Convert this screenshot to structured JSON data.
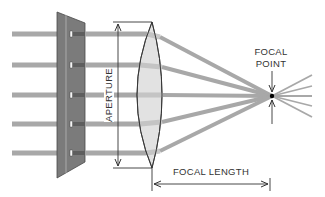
{
  "diagram": {
    "labels": {
      "aperture": "APERTURE",
      "focal_point_line1": "FOCAL",
      "focal_point_line2": "POINT",
      "focal_length": "FOCAL LENGTH"
    },
    "elements": {
      "plate": "slotted plate",
      "lens": "convex lens",
      "rays_count": 5
    },
    "colors": {
      "ray": "#a8a8a8",
      "ray_dark": "#6e6e6e",
      "plate": "#7b7b7b",
      "lens_fill": "#e2e2e2",
      "line": "#333333",
      "focal_dot": "#000000"
    }
  }
}
